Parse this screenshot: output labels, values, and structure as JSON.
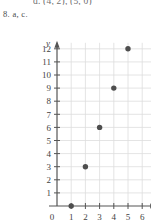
{
  "page": {
    "cutoff_text": "d. (4, 2), (5, 0)",
    "exercise_label": "8. a, c."
  },
  "colors": {
    "background": "#ffffff",
    "gridline": "#dddddd",
    "axis": "#555555",
    "point": "#4e4e4e",
    "text": "#3f3f3f"
  },
  "chart_data": {
    "type": "scatter",
    "title": "",
    "xlabel": "x",
    "ylabel": "y",
    "xlim": [
      0,
      6
    ],
    "ylim": [
      0,
      12
    ],
    "grid": true,
    "legend": null,
    "xticks": [
      0,
      1,
      2,
      3,
      4,
      5,
      6
    ],
    "xtick_labels": [
      "0",
      "1",
      "2",
      "3",
      "4",
      "5",
      "6"
    ],
    "yticks": [
      0,
      1,
      2,
      3,
      4,
      5,
      6,
      7,
      8,
      9,
      10,
      11,
      12
    ],
    "ytick_labels": [
      "0",
      "1",
      "2",
      "3",
      "4",
      "5",
      "6",
      "7",
      "8",
      "9",
      "10",
      "11",
      "12"
    ],
    "series": [
      {
        "name": "points",
        "points": [
          {
            "x": 1,
            "y": 0
          },
          {
            "x": 2,
            "y": 3
          },
          {
            "x": 3,
            "y": 6
          },
          {
            "x": 4,
            "y": 9
          },
          {
            "x": 5,
            "y": 12
          }
        ]
      }
    ]
  }
}
